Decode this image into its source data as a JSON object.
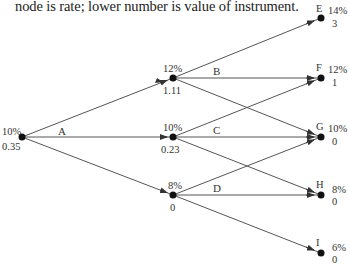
{
  "caption": "node is rate; lower number is value of instrument.",
  "nodes": {
    "root": {
      "rate": "10%",
      "value": "0.35"
    },
    "up": {
      "rate": "12%",
      "value": "1.11"
    },
    "mid": {
      "rate": "10%",
      "value": "0.23"
    },
    "down": {
      "rate": "8%",
      "value": "0"
    },
    "E": {
      "name": "E",
      "rate": "14%",
      "value": "3"
    },
    "F": {
      "name": "F",
      "rate": "12%",
      "value": "1"
    },
    "G": {
      "name": "G",
      "rate": "10%",
      "value": "0"
    },
    "H": {
      "name": "H",
      "rate": "8%",
      "value": "0"
    },
    "I": {
      "name": "I",
      "rate": "6%",
      "value": "0"
    }
  },
  "branches": {
    "A": "A",
    "B": "B",
    "C": "C",
    "D": "D"
  },
  "colors": {
    "line": "#444444",
    "node": "#111111"
  }
}
